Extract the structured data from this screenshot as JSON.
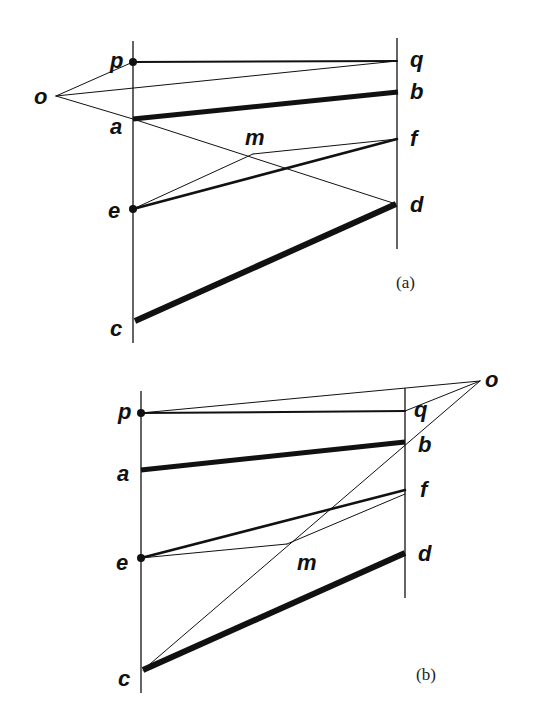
{
  "figure": {
    "background": "#ffffff",
    "ink": "#111111",
    "panels": [
      {
        "id": "a",
        "caption": "(a)",
        "caption_pos": [
          396,
          288
        ],
        "verticals": [
          {
            "name": "left-vertical",
            "x": 133,
            "y1": 41,
            "y2": 343
          },
          {
            "name": "right-vertical",
            "x": 397,
            "y1": 38,
            "y2": 249
          }
        ],
        "points": {
          "o": [
            56,
            96
          ],
          "p": [
            133,
            62
          ],
          "q": [
            397,
            61
          ],
          "a": [
            133,
            119
          ],
          "b": [
            398,
            92
          ],
          "f": [
            397,
            139
          ],
          "e": [
            133,
            209
          ],
          "d": [
            396,
            204
          ],
          "c": [
            135,
            321
          ],
          "m": [
            253,
            154
          ]
        },
        "labels": [
          {
            "text": "p",
            "x": 110,
            "y": 68
          },
          {
            "text": "q",
            "x": 410,
            "y": 67
          },
          {
            "text": "o",
            "x": 34,
            "y": 104
          },
          {
            "text": "b",
            "x": 410,
            "y": 99
          },
          {
            "text": "a",
            "x": 110,
            "y": 134
          },
          {
            "text": "m",
            "x": 245,
            "y": 145
          },
          {
            "text": "f",
            "x": 410,
            "y": 146
          },
          {
            "text": "e",
            "x": 108,
            "y": 218
          },
          {
            "text": "d",
            "x": 410,
            "y": 212
          },
          {
            "text": "c",
            "x": 110,
            "y": 336
          }
        ],
        "segments": [
          {
            "name": "line-p-q",
            "from": "p",
            "to": "q",
            "w": 2
          },
          {
            "name": "line-o-p",
            "from": "o",
            "to": "p",
            "w": 1
          },
          {
            "name": "line-o-q",
            "from": "o",
            "to": "q",
            "w": 1
          },
          {
            "name": "line-o-a",
            "from": "o",
            "to": "a",
            "w": 1
          },
          {
            "name": "line-a-b",
            "from": "a",
            "to": "b",
            "w": 5
          },
          {
            "name": "line-a-d",
            "from": "a",
            "to": "d",
            "w": 1
          },
          {
            "name": "line-e-m",
            "from": "e",
            "to": "m",
            "w": 1
          },
          {
            "name": "line-m-f",
            "from": "m",
            "to": "f",
            "w": 1
          },
          {
            "name": "line-e-f",
            "from": "e",
            "to": "f",
            "w": 2.5
          },
          {
            "name": "line-c-d",
            "from": "c",
            "to": "d",
            "w": 6
          }
        ],
        "dots": [
          "p",
          "e"
        ]
      },
      {
        "id": "b",
        "caption": "(b)",
        "caption_pos": [
          416,
          680
        ],
        "verticals": [
          {
            "name": "left-vertical",
            "x": 141,
            "y1": 391,
            "y2": 693
          },
          {
            "name": "right-vertical",
            "x": 405,
            "y1": 388,
            "y2": 598
          }
        ],
        "points": {
          "o": [
            480,
            381
          ],
          "p": [
            141,
            413
          ],
          "q": [
            405,
            411
          ],
          "a": [
            141,
            470
          ],
          "b": [
            405,
            442
          ],
          "f": [
            405,
            490
          ],
          "f2": [
            405,
            494
          ],
          "e": [
            141,
            558
          ],
          "d": [
            405,
            553
          ],
          "c": [
            143,
            670
          ],
          "m": [
            287,
            544
          ]
        },
        "labels": [
          {
            "text": "p",
            "x": 118,
            "y": 419
          },
          {
            "text": "q",
            "x": 414,
            "y": 417
          },
          {
            "text": "o",
            "x": 485,
            "y": 387
          },
          {
            "text": "b",
            "x": 418,
            "y": 452
          },
          {
            "text": "a",
            "x": 117,
            "y": 481
          },
          {
            "text": "f",
            "x": 420,
            "y": 497
          },
          {
            "text": "e",
            "x": 116,
            "y": 570
          },
          {
            "text": "m",
            "x": 297,
            "y": 570
          },
          {
            "text": "d",
            "x": 418,
            "y": 561
          },
          {
            "text": "c",
            "x": 118,
            "y": 686
          }
        ],
        "segments": [
          {
            "name": "line-p-q",
            "from": "p",
            "to": "q",
            "w": 2
          },
          {
            "name": "line-p-o",
            "from": "p",
            "to": "o",
            "w": 1
          },
          {
            "name": "line-q-o",
            "from": "q",
            "to": "o",
            "w": 1
          },
          {
            "name": "line-a-b",
            "from": "a",
            "to": "b",
            "w": 5
          },
          {
            "name": "line-c-o",
            "from": "c",
            "to": "o",
            "w": 1
          },
          {
            "name": "line-e-f",
            "from": "e",
            "to": "f",
            "w": 2.5
          },
          {
            "name": "line-e-m",
            "from": "e",
            "to": "m",
            "w": 1
          },
          {
            "name": "line-m-f",
            "from": "m",
            "to": "f2",
            "w": 1
          },
          {
            "name": "line-c-d",
            "from": "c",
            "to": "d",
            "w": 6
          }
        ],
        "dots": [
          "p",
          "e"
        ]
      }
    ]
  }
}
